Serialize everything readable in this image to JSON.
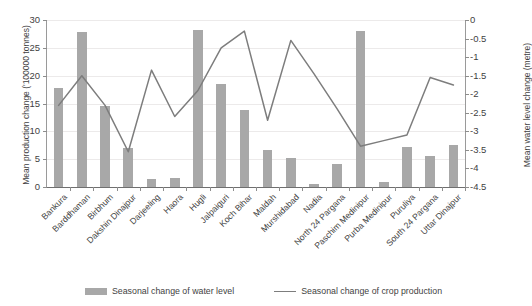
{
  "chart_data": {
    "type": "bar",
    "title": "",
    "categories": [
      "Bankura",
      "Barddhaman",
      "Birbhum",
      "Dakshin Dinajpur",
      "Darjeeling",
      "Haora",
      "Hugli",
      "Jalpaiguri",
      "Koch Bihar",
      "Maldah",
      "Murshidabad",
      "Nadia",
      "North 24 Pargana",
      "Paschim Medinipur",
      "Purba Medinipur",
      "Puruliya",
      "South 24 Pargana",
      "Uttar Dinajpur"
    ],
    "series": [
      {
        "name": "Seasonal change of water level",
        "mark": "bar",
        "axis": "left",
        "color": "#a8a8a8",
        "values": [
          17.8,
          27.9,
          14.6,
          7.0,
          1.5,
          1.7,
          28.2,
          18.5,
          13.9,
          6.6,
          5.2,
          0.5,
          4.2,
          28.1,
          0.9,
          7.1,
          5.5,
          7.5
        ]
      },
      {
        "name": "Seasonal change of crop production",
        "mark": "line",
        "axis": "right",
        "color": "#7d7d7d",
        "values": [
          -2.3,
          -1.5,
          -2.3,
          -3.55,
          -1.35,
          -2.6,
          -1.9,
          -0.75,
          -0.3,
          -2.7,
          -0.55,
          -1.45,
          -2.4,
          -3.4,
          -3.25,
          -3.1,
          -1.55,
          -1.75
        ]
      }
    ],
    "xlabel": "",
    "ylabel": "Mean production change ('100000 tonnes)",
    "y2label": "Mean water level change (metre)",
    "ylim": [
      0,
      30
    ],
    "y2lim": [
      -4.5,
      0
    ],
    "yticks": [
      "30",
      "25",
      "20",
      "15",
      "10",
      "5",
      "0"
    ],
    "y2ticks": [
      "0",
      "-0.5",
      "-1",
      "-1.5",
      "-2",
      "-2.5",
      "-3",
      "-3.5",
      "-4",
      "-4.5"
    ],
    "grid": true,
    "legend_position": "bottom"
  },
  "legend": {
    "items": [
      {
        "label": "Seasonal change of water level",
        "marker": "bar-swatch"
      },
      {
        "label": "Seasonal change of crop production",
        "marker": "line-swatch"
      }
    ]
  }
}
